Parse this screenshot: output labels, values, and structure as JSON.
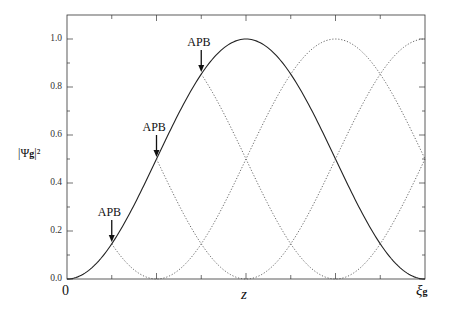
{
  "chart_data": {
    "type": "line",
    "title": "",
    "xlabel": "z",
    "ylabel": "|Ψg|²",
    "x_tick_labels": {
      "start": "0",
      "end": "ξg"
    },
    "x_range_normalized": [
      0,
      1
    ],
    "ylim": [
      0,
      1.1
    ],
    "y_ticks": [
      "0.0",
      "0.2",
      "0.4",
      "0.6",
      "0.8",
      "1.0"
    ],
    "grid": false,
    "legend": null,
    "series": [
      {
        "name": "solid",
        "style": "solid",
        "formula": "sin^2(pi*t)",
        "t_range": [
          0,
          1
        ],
        "points": [
          [
            0,
            0
          ],
          [
            0.125,
            0.146
          ],
          [
            0.25,
            0.5
          ],
          [
            0.375,
            0.854
          ],
          [
            0.5,
            1.0
          ],
          [
            0.625,
            0.854
          ],
          [
            0.75,
            0.5
          ],
          [
            0.875,
            0.146
          ],
          [
            1.0,
            0
          ]
        ]
      },
      {
        "name": "dotted-1",
        "style": "dotted",
        "formula": "sin^2(pi*(t-0.25))",
        "t_range": [
          0.125,
          1
        ],
        "points": [
          [
            0.125,
            0.146
          ],
          [
            0.25,
            0
          ],
          [
            0.5,
            0.5
          ],
          [
            0.75,
            1.0
          ],
          [
            1.0,
            0.5
          ]
        ]
      },
      {
        "name": "dotted-2",
        "style": "dotted",
        "formula": "sin^2(pi*(t-0.5))",
        "t_range": [
          0.25,
          1
        ],
        "points": [
          [
            0.25,
            0.5
          ],
          [
            0.5,
            0
          ],
          [
            0.75,
            0.5
          ],
          [
            1.0,
            1.0
          ]
        ]
      },
      {
        "name": "dotted-3",
        "style": "dotted",
        "formula": "sin^2(pi*(t-0.75))",
        "t_range": [
          0.375,
          1
        ],
        "points": [
          [
            0.375,
            0.854
          ],
          [
            0.5,
            0.5
          ],
          [
            0.75,
            0
          ],
          [
            1.0,
            0.5
          ]
        ]
      }
    ],
    "annotations": [
      {
        "text": "APB",
        "t": 0.125,
        "y": 0.146
      },
      {
        "text": "APB",
        "t": 0.25,
        "y": 0.5
      },
      {
        "text": "APB",
        "t": 0.375,
        "y": 0.854
      }
    ]
  },
  "labels": {
    "y_main": "|Ψ",
    "y_sub": "g",
    "y_tail": "|²",
    "x_z": "z",
    "x_zero": "0",
    "x_end_main": "ξ",
    "x_end_sub": "g",
    "apb": "APB"
  }
}
